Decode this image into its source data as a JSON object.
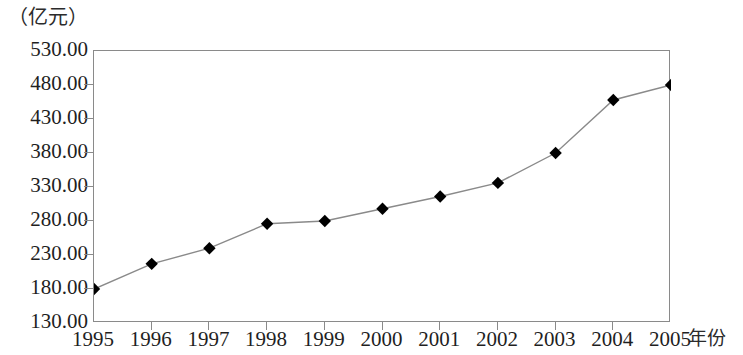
{
  "chart_data": {
    "type": "line",
    "title": "",
    "subtitle": "",
    "unit_label": "（亿元）",
    "xlabel": "年份",
    "ylabel": "",
    "categories": [
      "1995",
      "1996",
      "1997",
      "1998",
      "1999",
      "2000",
      "2001",
      "2002",
      "2003",
      "2004",
      "2005"
    ],
    "values": [
      180.0,
      217.0,
      240.0,
      276.0,
      280.0,
      298.0,
      316.0,
      336.0,
      380.0,
      458.0,
      480.0
    ],
    "series": [
      {
        "name": "",
        "values": [
          180.0,
          217.0,
          240.0,
          276.0,
          280.0,
          298.0,
          316.0,
          336.0,
          380.0,
          458.0,
          480.0
        ]
      }
    ],
    "ylim": [
      130.0,
      530.0
    ],
    "ytick_labels": [
      "530.00",
      "480.00",
      "430.00",
      "380.00",
      "330.00",
      "280.00",
      "230.00",
      "180.00",
      "130.00"
    ],
    "ytick_values": [
      530,
      480,
      430,
      380,
      330,
      280,
      230,
      180,
      130
    ],
    "ytick_step": 50,
    "xtick_labels": [
      "1995",
      "1996",
      "1997",
      "1998",
      "1999",
      "2000",
      "2001",
      "2002",
      "2003",
      "2004",
      "2005"
    ],
    "grid": false,
    "legend": "none",
    "marker": "diamond",
    "marker_color": "#000000",
    "line_color": "#8a8a8a",
    "axis_color": "#8a8a8a"
  }
}
